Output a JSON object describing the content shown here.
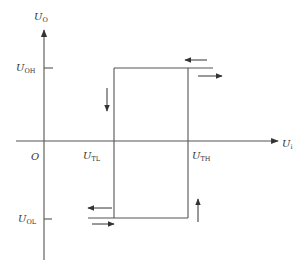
{
  "diagram": {
    "colors": {
      "line": "#555555",
      "arrow": "#333333",
      "text": "#333333",
      "background": "#ffffff"
    },
    "axes": {
      "y_axis": {
        "label_main": "U",
        "label_sub": "O"
      },
      "x_axis": {
        "label_main": "U",
        "label_sub": "i"
      },
      "origin_label": "O"
    },
    "levels": {
      "high": {
        "label_main": "U",
        "label_sub": "OH"
      },
      "low": {
        "label_main": "U",
        "label_sub": "OL"
      }
    },
    "thresholds": {
      "lower": {
        "label_main": "U",
        "label_sub": "TL"
      },
      "upper": {
        "label_main": "U",
        "label_sub": "TH"
      }
    },
    "arrows": [
      {
        "id": "top-left",
        "direction": "left"
      },
      {
        "id": "top-right",
        "direction": "right"
      },
      {
        "id": "left-down",
        "direction": "down"
      },
      {
        "id": "right-up",
        "direction": "up"
      },
      {
        "id": "bottom-left",
        "direction": "left"
      },
      {
        "id": "bottom-right",
        "direction": "right"
      }
    ]
  }
}
